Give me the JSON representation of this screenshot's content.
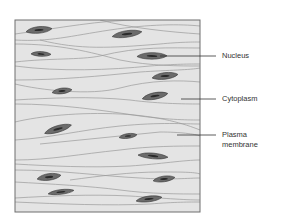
{
  "figure": {
    "type": "histology-diagram",
    "colors": {
      "background": "#ffffff",
      "tissue_fill": "#e4e4e4",
      "border": "#6e6e6e",
      "membrane_lines": "#9a9a9a",
      "nucleus_fill": "#6b6b6b",
      "nucleus_outline": "#3a3a3a",
      "nucleus_core": "#2a2a2a",
      "leader_line": "#333333",
      "label_text": "#333333"
    }
  },
  "labels": {
    "nucleus": "Nucleus",
    "cytoplasm": "Cytoplasm",
    "plasma_membrane_line1": "Plasma",
    "plasma_membrane_line2": "membrane"
  },
  "nuclei": [
    {
      "cx": 39,
      "cy": 30,
      "rx": 13,
      "ry": 3.5,
      "rot": -3
    },
    {
      "cx": 127,
      "cy": 34,
      "rx": 15,
      "ry": 3.5,
      "rot": -6
    },
    {
      "cx": 41,
      "cy": 54,
      "rx": 10,
      "ry": 2.5,
      "rot": 5
    },
    {
      "cx": 152,
      "cy": 56,
      "rx": 15,
      "ry": 3.5,
      "rot": 2
    },
    {
      "cx": 165,
      "cy": 76,
      "rx": 13,
      "ry": 3.5,
      "rot": -4
    },
    {
      "cx": 62,
      "cy": 91,
      "rx": 10,
      "ry": 3,
      "rot": -4
    },
    {
      "cx": 155,
      "cy": 96,
      "rx": 13,
      "ry": 3.5,
      "rot": -8
    },
    {
      "cx": 58,
      "cy": 129,
      "rx": 14,
      "ry": 3.5,
      "rot": -14
    },
    {
      "cx": 128,
      "cy": 136,
      "rx": 9,
      "ry": 2.5,
      "rot": -5
    },
    {
      "cx": 153,
      "cy": 156,
      "rx": 15,
      "ry": 3,
      "rot": 7
    },
    {
      "cx": 49,
      "cy": 177,
      "rx": 12,
      "ry": 3.5,
      "rot": -5
    },
    {
      "cx": 164,
      "cy": 179,
      "rx": 11,
      "ry": 3,
      "rot": -5
    },
    {
      "cx": 61,
      "cy": 192,
      "rx": 13,
      "ry": 2.5,
      "rot": -5
    },
    {
      "cx": 149,
      "cy": 199,
      "rx": 13,
      "ry": 3,
      "rot": -5
    }
  ],
  "membranes": [
    "M15,34 C60,28 100,20 140,20",
    "M100,20 C130,28 170,32 200,34",
    "M15,40 C50,42 70,36 110,30 C150,24 180,24 200,26",
    "M15,44 C60,44 90,52 120,60 C150,66 180,66 200,66",
    "M40,40 C80,50 110,48 160,44 C180,42 195,42 200,42",
    "M15,62 C50,58 80,60 100,56 C140,46 170,48 200,48",
    "M15,66 C60,72 110,70 150,66 C175,64 190,64 200,64",
    "M15,80 C60,80 100,76 140,72 C170,70 190,70 200,68",
    "M15,84 C40,90 90,96 120,88 C150,80 180,80 200,82",
    "M15,100 C50,98 90,96 130,100 C160,104 190,104 200,104",
    "M15,104 C60,104 100,110 140,116 C170,120 190,120 200,120",
    "M15,122 C40,116 80,112 120,114 C160,116 185,124 200,130",
    "M15,140 C50,138 80,130 120,126 C160,122 185,124 200,124",
    "M40,144 C80,140 120,136 160,132 C180,132 195,134 200,136",
    "M15,160 C50,160 80,154 120,150 C150,146 180,146 200,146",
    "M15,164 C50,166 90,168 130,166 C160,164 185,160 200,160",
    "M15,170 C60,170 100,176 140,178 C170,180 190,178 200,178",
    "M70,180 C100,176 130,172 160,172 C180,172 195,172 200,174",
    "M15,182 C50,184 90,186 120,190 C150,194 180,194 200,194",
    "M15,198 C50,196 90,194 130,196 C160,198 185,200 200,200",
    "M15,202 C60,204 110,206 150,204 C175,202 190,202 200,202"
  ],
  "leaders": {
    "nucleus": {
      "x1": 160,
      "y1": 56,
      "x2": 216,
      "y2": 56
    },
    "cytoplasm": {
      "x1": 181,
      "y1": 99,
      "x2": 216,
      "y2": 99
    },
    "plasma_membrane": {
      "x1": 177,
      "y1": 135,
      "x2": 216,
      "y2": 135
    }
  }
}
